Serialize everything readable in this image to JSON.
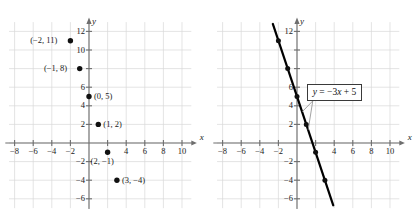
{
  "figure": {
    "background": "#ffffff",
    "grid_color": "#d8d8d8",
    "axis_color": "#6e6e6e",
    "point_color": "#111111",
    "line_color": "#000000",
    "text_color": "#1a1a1a"
  },
  "chart_data": [
    {
      "type": "scatter",
      "title": "",
      "xlabel": "x",
      "ylabel": "y",
      "xlim": [
        -9,
        11.5
      ],
      "ylim": [
        -7.2,
        13.2
      ],
      "xticks": [
        -8,
        -6,
        -4,
        -2,
        4,
        6,
        8,
        10
      ],
      "yticks": [
        12,
        10,
        6,
        4,
        2,
        -2,
        -4,
        -6
      ],
      "xtick_labels": [
        "-8",
        "-6",
        "-4",
        "-2",
        "4",
        "6",
        "8",
        "10"
      ],
      "ytick_labels": [
        "12",
        "10",
        "6",
        "4",
        "2",
        "-2",
        "-4",
        "-6"
      ],
      "grid": true,
      "grid_step": 2,
      "points": [
        {
          "x": -2,
          "y": 11,
          "label": "(-2, 11)",
          "label_side": "left"
        },
        {
          "x": -1,
          "y": 8,
          "label": "(-1, 8)",
          "label_side": "left"
        },
        {
          "x": 0,
          "y": 5,
          "label": "(0, 5)",
          "label_side": "right"
        },
        {
          "x": 1,
          "y": 2,
          "label": "(1, 2)",
          "label_side": "right"
        },
        {
          "x": 2,
          "y": -1,
          "label": "(2, -1)",
          "label_side": "below"
        },
        {
          "x": 3,
          "y": -4,
          "label": "(3, -4)",
          "label_side": "right"
        }
      ]
    },
    {
      "type": "line",
      "title": "",
      "xlabel": "x",
      "ylabel": "y",
      "xlim": [
        -9,
        11.5
      ],
      "ylim": [
        -7.2,
        13.2
      ],
      "xticks": [
        -8,
        -6,
        -4,
        -2,
        4,
        6,
        8,
        10
      ],
      "yticks": [
        12,
        6,
        4,
        2,
        -2,
        -4,
        -6
      ],
      "xtick_labels": [
        "-8",
        "-6",
        "-4",
        "-2",
        "4",
        "6",
        "8",
        "10"
      ],
      "ytick_labels": [
        "12",
        "6",
        "4",
        "2",
        "-2",
        "-4",
        "-6"
      ],
      "grid": true,
      "grid_step": 2,
      "equation": "y = -3x + 5",
      "slope": -3,
      "intercept": 5,
      "x_domain": [
        -2.6,
        3.9
      ],
      "points": [
        {
          "x": -2,
          "y": 11
        },
        {
          "x": -1,
          "y": 8
        },
        {
          "x": 0,
          "y": 5
        },
        {
          "x": 1,
          "y": 2
        },
        {
          "x": 2,
          "y": -1
        },
        {
          "x": 3,
          "y": -4
        }
      ],
      "annotation": {
        "text_parts": {
          "lhs": "y",
          "eq": " = ",
          "coef": "−3",
          "var": "x",
          "rhs": " + 5"
        },
        "full_text": "y = −3x + 5",
        "leader_targets": [
          {
            "x": 0.55,
            "y": 3.35
          },
          {
            "x": 1.2,
            "y": 1.4
          }
        ]
      }
    }
  ]
}
